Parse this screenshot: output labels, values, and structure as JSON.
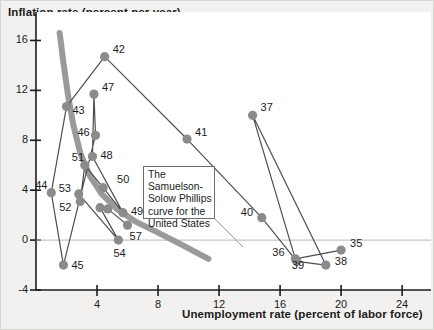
{
  "figure": {
    "background_color": "#f2f1ef",
    "plot_background_color": "#ffffff"
  },
  "callout": {
    "text": "The Samuelson-Solow Phillips curve for the United States"
  },
  "chart_data": {
    "type": "scatter",
    "title": "",
    "xlabel": "Unemployment rate (percent of labor force)",
    "ylabel": "Inflation rate (percent per year)",
    "xlim": [
      0,
      25.5
    ],
    "ylim": [
      -4,
      17
    ],
    "xticks": [
      4,
      8,
      12,
      16,
      20,
      24
    ],
    "yticks": [
      -4,
      0,
      4,
      8,
      12,
      16
    ],
    "grid": false,
    "legend": null,
    "zero_line": true,
    "marker_color": "#8b8b8b",
    "connector_color": "#4d4d4d",
    "fitted_curve_color": "#9a9a9a",
    "fitted_curve_label": "Samuelson-Solow Phillips curve",
    "fitted_curve_points": [
      [
        1.55,
        16.6
      ],
      [
        1.8,
        14.2
      ],
      [
        2.1,
        11.6
      ],
      [
        2.45,
        9.2
      ],
      [
        2.9,
        7.0
      ],
      [
        3.5,
        5.2
      ],
      [
        4.3,
        3.7
      ],
      [
        5.3,
        2.5
      ],
      [
        6.5,
        1.5
      ],
      [
        8.0,
        0.6
      ],
      [
        9.6,
        -0.4
      ],
      [
        11.3,
        -1.5
      ]
    ],
    "points": [
      {
        "label": "35",
        "x": 20.0,
        "y": -0.8,
        "label_dx": 9,
        "label_dy": -7
      },
      {
        "label": "36",
        "x": 17.0,
        "y": -1.5,
        "label_dx": -23,
        "label_dy": -7
      },
      {
        "label": "37",
        "x": 14.2,
        "y": 10.0,
        "label_dx": 8,
        "label_dy": -8
      },
      {
        "label": "38",
        "x": 19.0,
        "y": -2.0,
        "label_dx": 9,
        "label_dy": -4
      },
      {
        "label": "39",
        "x": 17.1,
        "y": -1.7,
        "label_dx": -5,
        "label_dy": 4
      },
      {
        "label": "40",
        "x": 14.8,
        "y": 1.8,
        "label_dx": -21,
        "label_dy": -6
      },
      {
        "label": "41",
        "x": 9.9,
        "y": 8.1,
        "label_dx": 8,
        "label_dy": -7
      },
      {
        "label": "42",
        "x": 4.5,
        "y": 14.7,
        "label_dx": 8,
        "label_dy": -8
      },
      {
        "label": "43",
        "x": 2.0,
        "y": 10.7,
        "label_dx": 6,
        "label_dy": 3
      },
      {
        "label": "44",
        "x": 1.0,
        "y": 3.8,
        "label_dx": -16,
        "label_dy": -8
      },
      {
        "label": "45",
        "x": 1.8,
        "y": -2.0,
        "label_dx": 8,
        "label_dy": 0
      },
      {
        "label": "46",
        "x": 3.9,
        "y": 8.4,
        "label_dx": -18,
        "label_dy": -3
      },
      {
        "label": "47",
        "x": 3.8,
        "y": 11.7,
        "label_dx": 8,
        "label_dy": -7
      },
      {
        "label": "48",
        "x": 3.7,
        "y": 6.7,
        "label_dx": 8,
        "label_dy": -2
      },
      {
        "label": "49",
        "x": 5.7,
        "y": 2.2,
        "label_dx": 8,
        "label_dy": -2
      },
      {
        "label": "50",
        "x": 4.4,
        "y": 4.2,
        "label_dx": 14,
        "label_dy": -9
      },
      {
        "label": "51",
        "x": 3.2,
        "y": 6.0,
        "label_dx": -13,
        "label_dy": -8
      },
      {
        "label": "52",
        "x": 2.9,
        "y": 3.1,
        "label_dx": -21,
        "label_dy": 6
      },
      {
        "label": "53",
        "x": 2.8,
        "y": 3.7,
        "label_dx": -20,
        "label_dy": -6
      },
      {
        "label": "54",
        "x": 5.4,
        "y": 0.0,
        "label_dx": -5,
        "label_dy": 13
      },
      {
        "label": "55",
        "x": 4.2,
        "y": 2.6,
        "label_dx": 0,
        "label_dy": 0
      },
      {
        "label": "56",
        "x": 4.7,
        "y": 2.5,
        "label_dx": 0,
        "label_dy": 0
      },
      {
        "label": "57",
        "x": 6.0,
        "y": 1.2,
        "label_dx": 2,
        "label_dy": 11
      }
    ],
    "path_order": [
      "35",
      "36",
      "37",
      "38",
      "39",
      "40",
      "41",
      "42",
      "43",
      "44",
      "45",
      "46",
      "47",
      "48",
      "49",
      "50",
      "51",
      "52",
      "53",
      "54",
      "55",
      "56",
      "57"
    ]
  }
}
